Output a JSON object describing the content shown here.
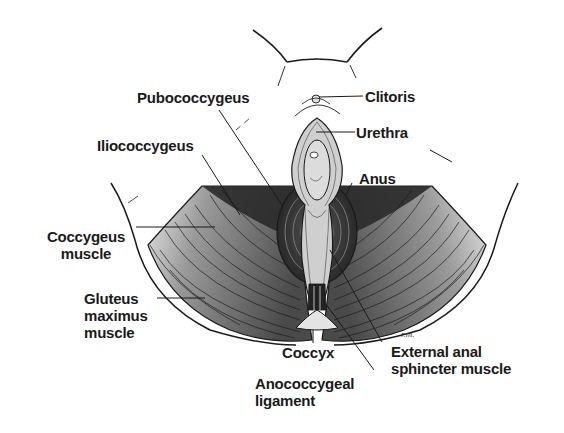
{
  "diagram": {
    "colors": {
      "background": "#ffffff",
      "ink": "#1a1a1a",
      "muscle_dark": "#3a3a3a",
      "muscle_mid": "#6e6e6e",
      "muscle_light": "#a8a8a8",
      "tissue_light": "#d6d6d6",
      "coccyx_fill": "#e4e4e4"
    },
    "labels": {
      "clitoris": "Clitoris",
      "urethra": "Urethra",
      "pubococcygeus": "Pubococcygeus",
      "iliococcygeus": "Iliococcygeus",
      "anus": "Anus",
      "coccygeus_line1": "Coccygeus",
      "coccygeus_line2": "muscle",
      "gluteus_line1": "Gluteus",
      "gluteus_line2": "maximus",
      "gluteus_line3": "muscle",
      "coccyx": "Coccyx",
      "external_anal_line1": "External anal",
      "external_anal_line2": "sphincter muscle",
      "anococcygeal_line1": "Anococcygeal",
      "anococcygeal_line2": "ligament"
    },
    "signature": "r.m."
  }
}
